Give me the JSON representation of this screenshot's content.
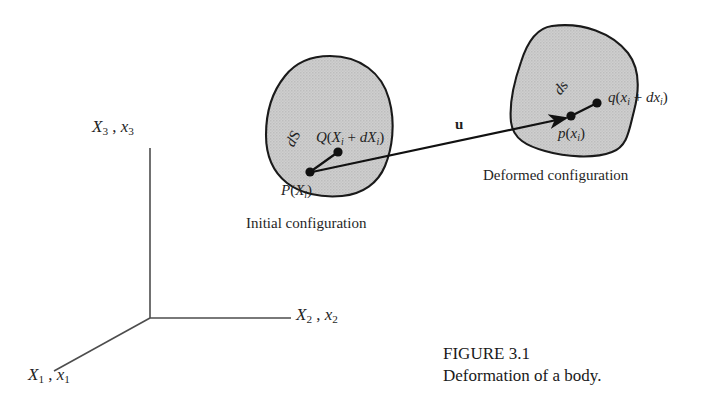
{
  "figure": {
    "caption_title": "FIGURE 3.1",
    "caption_text": "Deformation of a body.",
    "colors": {
      "background": "#ffffff",
      "body_fill": "#cccccc",
      "body_stroke": "#1a1a1a",
      "axis_stroke": "#4d4d4d",
      "vector_stroke": "#111111",
      "text": "#1f1f1f"
    },
    "axes": {
      "label_x3": "X₃ , x₃",
      "label_x2": "X₂ , x₂",
      "label_x1": "X₁ , x₁",
      "origin": "O"
    },
    "initial_configuration": {
      "caption": "Initial configuration",
      "point_P_label": "P(X i )",
      "point_Q_label": "Q(X i + dX i )",
      "segment_label": "dS"
    },
    "deformed_configuration": {
      "caption": "Deformed configuration",
      "point_p_label": "p(x i )",
      "point_q_label": "q(x i + dx i )",
      "segment_label": "ds"
    },
    "displacement_vector": {
      "label": "u"
    }
  }
}
